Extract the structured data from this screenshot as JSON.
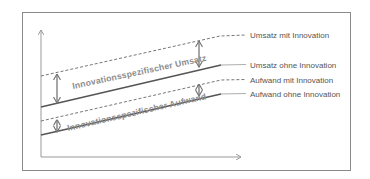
{
  "diagram": {
    "labels": {
      "umsatz_mit": "Umsatz mit Innovation",
      "umsatz_ohne": "Umsatz ohne Innovation",
      "aufwand_mit": "Aufwand mit Innovation",
      "aufwand_ohne": "Aufwand ohne Innovation"
    },
    "annotations": {
      "umsatz_gap": "Innovationsspezifischer Umsatz",
      "aufwand_gap": "Innovationsspezifischer Aufwand"
    },
    "colors": {
      "line": "#555555",
      "dashed": "#777777",
      "axis": "#999999",
      "arrow": "#777777",
      "annotation_text": "#8c8c8c",
      "frame": "#8a8a8a"
    }
  }
}
